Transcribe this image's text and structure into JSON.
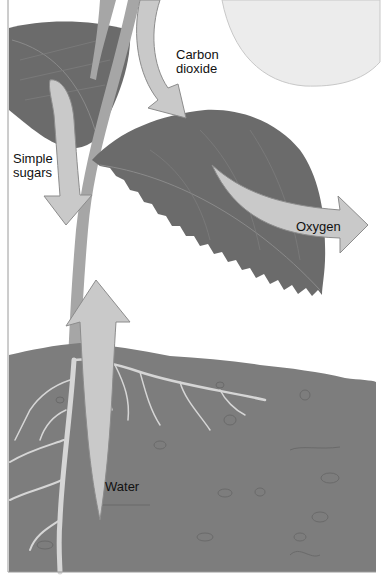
{
  "diagram": {
    "labels": {
      "carbon_dioxide": "Carbon\ndioxide",
      "simple_sugars": "Simple\nsugars",
      "oxygen": "Oxygen",
      "water": "Water"
    },
    "elements": [
      "sun",
      "upper-leaf",
      "main-leaf",
      "stem",
      "roots",
      "soil"
    ],
    "colors": {
      "background": "#ffffff",
      "sun": "#ececec",
      "sun_outline": "#c8c8c8",
      "leaf": "#6b6b6b",
      "leaf_vein": "#8a8a8a",
      "stem": "#a6a6a6",
      "arrow_fill": "#c9c9c9",
      "arrow_stroke": "#8c8c8c",
      "soil": "#7d7d7d",
      "root": "#d6d6d6",
      "text": "#111111"
    }
  }
}
